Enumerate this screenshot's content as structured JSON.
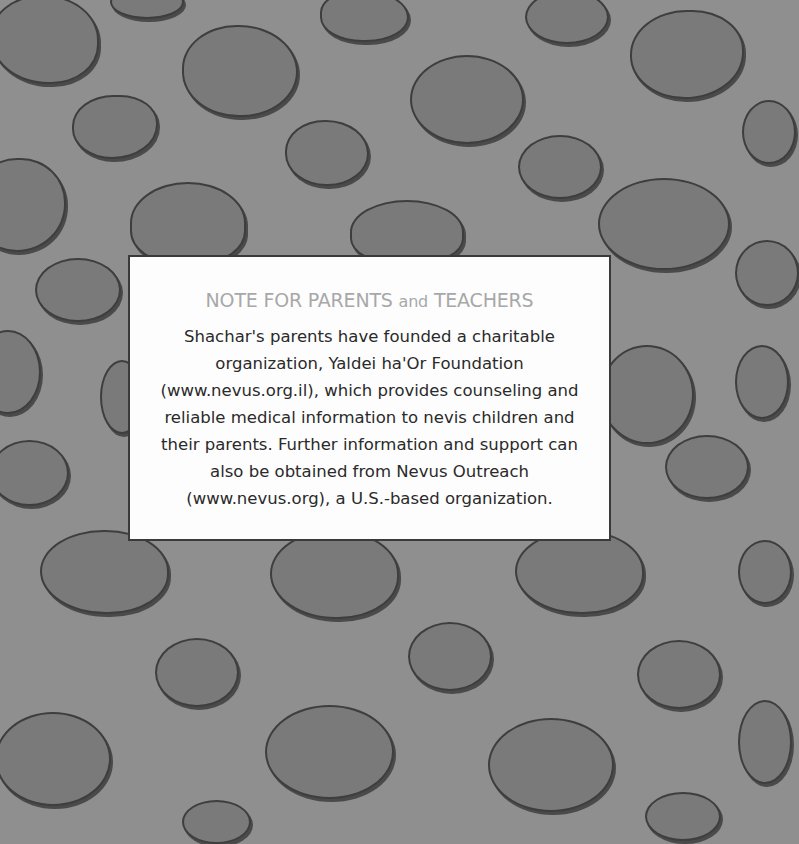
{
  "note": {
    "title_main_1": "NOTE FOR PARENTS",
    "title_and": "and",
    "title_main_2": "TEACHERS",
    "body_lines": [
      "Shachar's parents have founded a charitable",
      "organization, Yaldei ha'Or Foundation",
      "(www.nevus.org.il), which provides counseling and",
      "reliable medical information to nevis children and",
      "their parents. Further information and support can",
      "also be obtained from Nevus Outreach",
      "(www.nevus.org), a U.S.-based organization."
    ]
  },
  "colors": {
    "background": "#8f8f8f",
    "blob_fill": "#7a7a7a",
    "blob_outline": "#3e3e3e",
    "note_bg": "#fdfdfd",
    "title": "#a8a8a8",
    "body_text": "#2a2a2a"
  }
}
